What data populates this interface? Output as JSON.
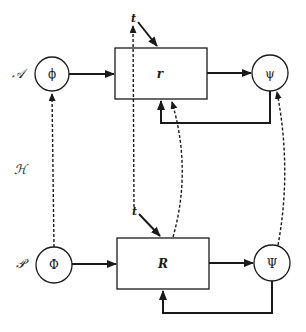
{
  "diagram": {
    "type": "block-diagram",
    "row_labels": {
      "top": "𝒜",
      "middle": "ℋ",
      "bottom": "𝒫"
    },
    "nodes": {
      "phi_small": {
        "label": "ϕ",
        "shape": "circle"
      },
      "box_r": {
        "label": "r",
        "shape": "rectangle"
      },
      "psi_small": {
        "label": "ψ",
        "shape": "circle"
      },
      "phi_cap": {
        "label": "Φ",
        "shape": "circle"
      },
      "box_R": {
        "label": "R",
        "shape": "rectangle"
      },
      "psi_cap": {
        "label": "Ψ",
        "shape": "circle"
      }
    },
    "time_inputs": {
      "top": "t",
      "bottom": "t"
    },
    "edges": [
      {
        "from": "phi_small",
        "to": "box_r",
        "style": "solid"
      },
      {
        "from": "box_r",
        "to": "psi_small",
        "style": "solid"
      },
      {
        "from": "psi_small",
        "to": "box_r",
        "style": "solid",
        "kind": "feedback"
      },
      {
        "from": "t_top",
        "to": "box_r",
        "style": "solid"
      },
      {
        "from": "phi_cap",
        "to": "box_R",
        "style": "solid"
      },
      {
        "from": "box_R",
        "to": "psi_cap",
        "style": "solid"
      },
      {
        "from": "psi_cap",
        "to": "box_R",
        "style": "solid",
        "kind": "feedback"
      },
      {
        "from": "t_bottom",
        "to": "box_R",
        "style": "solid"
      },
      {
        "from": "phi_cap",
        "to": "phi_small",
        "style": "dashed"
      },
      {
        "from": "t_bottom",
        "to": "t_top",
        "style": "dashed"
      },
      {
        "from": "box_R",
        "to": "box_r",
        "style": "dashed"
      },
      {
        "from": "psi_cap",
        "to": "psi_small",
        "style": "dashed"
      }
    ],
    "colors": {
      "stroke": "#1a1a1a",
      "background": "#ffffff"
    }
  }
}
